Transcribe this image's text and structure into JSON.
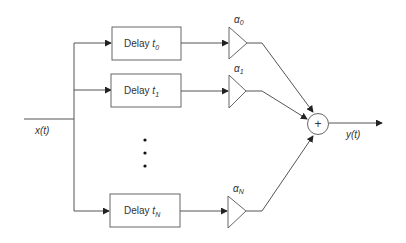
{
  "diagram": {
    "input_label": "x(t)",
    "output_label": "y(t)",
    "summer_symbol": "+",
    "branches": [
      {
        "delay_text": "Delay ",
        "delay_var": "t",
        "delay_sub": "0",
        "gain_var": "α",
        "gain_sub": "0"
      },
      {
        "delay_text": "Delay ",
        "delay_var": "t",
        "delay_sub": "1",
        "gain_var": "α",
        "gain_sub": "1"
      },
      {
        "delay_text": "Delay ",
        "delay_var": "t",
        "delay_sub": "N",
        "gain_var": "α",
        "gain_sub": "N"
      }
    ],
    "ellipsis": "vertical dots between branch 1 and branch N",
    "colors": {
      "line": "#555555",
      "box_stroke": "#666666",
      "text": "#333333",
      "background": "#ffffff"
    }
  }
}
